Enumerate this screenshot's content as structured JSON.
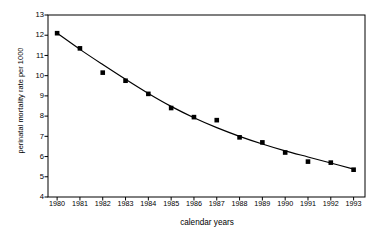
{
  "chart_data": {
    "type": "scatter",
    "title": "",
    "subtitle": "",
    "xlabel": "calendar years",
    "ylabel": "perinatal mortality rate per 1000",
    "x": [
      1980,
      1981,
      1982,
      1983,
      1984,
      1985,
      1986,
      1987,
      1988,
      1989,
      1990,
      1991,
      1992,
      1993
    ],
    "categories": [
      "1980",
      "1981",
      "1982",
      "1983",
      "1984",
      "1985",
      "1986",
      "1987",
      "1988",
      "1989",
      "1990",
      "1991",
      "1992",
      "1993"
    ],
    "values": [
      12.1,
      11.35,
      10.15,
      9.75,
      9.1,
      8.4,
      7.95,
      7.8,
      6.95,
      6.7,
      6.2,
      5.75,
      5.7,
      5.35
    ],
    "series": [
      {
        "name": "perinatal mortality rate",
        "marker": "filled-square",
        "color": "#000000",
        "values": [
          12.1,
          11.35,
          10.15,
          9.75,
          9.1,
          8.4,
          7.95,
          7.8,
          6.95,
          6.7,
          6.2,
          5.75,
          5.7,
          5.35
        ]
      },
      {
        "name": "fitted trend curve",
        "type": "line",
        "color": "#000000",
        "values": [
          12.1,
          11.3,
          10.55,
          9.82,
          9.12,
          8.48,
          7.92,
          7.43,
          7.0,
          6.62,
          6.28,
          5.98,
          5.68,
          5.38
        ]
      }
    ],
    "xlim": [
      1979.6,
      1993.5
    ],
    "ylim": [
      4,
      13
    ],
    "yticks": [
      4,
      5,
      6,
      7,
      8,
      9,
      10,
      11,
      12,
      13
    ],
    "ytick_labels": [
      "4",
      "5",
      "6",
      "7",
      "8",
      "9",
      "10",
      "11",
      "12",
      "13"
    ],
    "xticks": [
      1980,
      1981,
      1982,
      1983,
      1984,
      1985,
      1986,
      1987,
      1988,
      1989,
      1990,
      1991,
      1992,
      1993
    ],
    "xtick_labels": [
      "1980",
      "1981",
      "1982",
      "1983",
      "1984",
      "1985",
      "1986",
      "1987",
      "1988",
      "1989",
      "1990",
      "1991",
      "1992",
      "1993"
    ],
    "grid": false,
    "legend": false,
    "legend_position": "none",
    "background_color": "#ffffff",
    "axis_color": "#000000",
    "marker_color": "#000000",
    "line_color": "#000000"
  }
}
